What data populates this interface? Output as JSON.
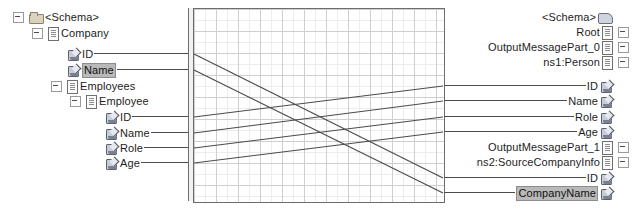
{
  "app": {
    "kind": "schema-mapper",
    "colors": {
      "link": "#4c4c4c",
      "grid_minor": "#ededed",
      "grid_major": "#cfcfcf",
      "panel_border": "#6d6d6d",
      "selection": "#b9b9b9",
      "folder_icon": "#d9d2bd",
      "attribute_icon": "#c9ccd6",
      "text": "#1d1d1d"
    }
  },
  "source_tree": {
    "name": "source-schema-tree",
    "nodes": [
      {
        "label": "<Schema>",
        "icon": "folder-icon",
        "indent": 0,
        "expander": "minus",
        "y": 17,
        "selected": false,
        "connector": false
      },
      {
        "label": "Company",
        "icon": "document-icon",
        "indent": 1,
        "expander": "minus",
        "y": 33,
        "selected": false,
        "connector": false
      },
      {
        "label": "ID",
        "icon": "attribute-icon",
        "indent": 2,
        "expander": "none",
        "y": 54,
        "selected": false,
        "connector": true
      },
      {
        "label": "Name",
        "icon": "attribute-icon",
        "indent": 2,
        "expander": "none",
        "y": 70,
        "selected": true,
        "connector": true
      },
      {
        "label": "Employees",
        "icon": "document-icon",
        "indent": 2,
        "expander": "minus",
        "y": 86,
        "selected": false,
        "connector": false
      },
      {
        "label": "Employee",
        "icon": "document-icon",
        "indent": 3,
        "expander": "minus",
        "y": 101,
        "selected": false,
        "connector": false
      },
      {
        "label": "ID",
        "icon": "attribute-icon",
        "indent": 4,
        "expander": "none",
        "y": 117,
        "selected": false,
        "connector": true
      },
      {
        "label": "Name",
        "icon": "attribute-icon",
        "indent": 4,
        "expander": "none",
        "y": 133,
        "selected": false,
        "connector": true
      },
      {
        "label": "Role",
        "icon": "attribute-icon",
        "indent": 4,
        "expander": "none",
        "y": 148,
        "selected": false,
        "connector": true
      },
      {
        "label": "Age",
        "icon": "attribute-icon",
        "indent": 4,
        "expander": "none",
        "y": 163,
        "selected": false,
        "connector": true
      }
    ]
  },
  "destination_tree": {
    "name": "destination-schema-tree",
    "nodes": [
      {
        "label": "<Schema>",
        "icon": "schema-icon",
        "expander": "none",
        "y": 17,
        "selected": false,
        "connector": false
      },
      {
        "label": "Root",
        "icon": "document-icon",
        "expander": "minus",
        "y": 32,
        "selected": false,
        "connector": false
      },
      {
        "label": "OutputMessagePart_0",
        "icon": "document-icon",
        "expander": "minus",
        "y": 47,
        "selected": false,
        "connector": false
      },
      {
        "label": "ns1:Person",
        "icon": "document-icon",
        "expander": "minus",
        "y": 62,
        "selected": false,
        "connector": false
      },
      {
        "label": "ID",
        "icon": "attribute-icon",
        "expander": "none",
        "y": 86,
        "selected": false,
        "connector": true
      },
      {
        "label": "Name",
        "icon": "attribute-icon",
        "expander": "none",
        "y": 101,
        "selected": false,
        "connector": true
      },
      {
        "label": "Role",
        "icon": "attribute-icon",
        "expander": "none",
        "y": 117,
        "selected": false,
        "connector": true
      },
      {
        "label": "Age",
        "icon": "attribute-icon",
        "expander": "none",
        "y": 132,
        "selected": false,
        "connector": true
      },
      {
        "label": "OutputMessagePart_1",
        "icon": "document-icon",
        "expander": "minus",
        "y": 147,
        "selected": false,
        "connector": false
      },
      {
        "label": "ns2:SourceCompanyInfo",
        "icon": "document-icon",
        "expander": "minus",
        "y": 162,
        "selected": false,
        "connector": false
      },
      {
        "label": "ID",
        "icon": "attribute-icon",
        "expander": "none",
        "y": 178,
        "selected": false,
        "connector": true
      },
      {
        "label": "CompanyName",
        "icon": "attribute-icon",
        "expander": "none",
        "y": 193,
        "selected": true,
        "connector": true
      }
    ]
  },
  "links": {
    "name": "mapping-links",
    "x_left": 6,
    "x_right": 255,
    "items": [
      {
        "from": "Company/ID",
        "to": "ns2:SourceCompanyInfo/ID",
        "y1": 46,
        "y2": 170
      },
      {
        "from": "Company/Name",
        "to": "CompanyName",
        "y1": 62,
        "y2": 185
      },
      {
        "from": "Employee/ID",
        "to": "ns1:Person/ID",
        "y1": 109,
        "y2": 78
      },
      {
        "from": "Employee/Name",
        "to": "ns1:Person/Name",
        "y1": 125,
        "y2": 93
      },
      {
        "from": "Employee/Role",
        "to": "ns1:Person/Role",
        "y1": 140,
        "y2": 109
      },
      {
        "from": "Employee/Age",
        "to": "ns1:Person/Age",
        "y1": 155,
        "y2": 124
      }
    ]
  }
}
